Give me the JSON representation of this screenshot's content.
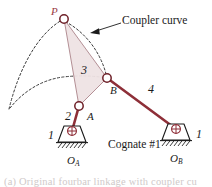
{
  "figure": {
    "background_color": "#ffffff"
  },
  "colors": {
    "link_red": "#8e2f38",
    "link_red_dark": "#6e2028",
    "coupler_fill": "#efe3e4",
    "coupler_stroke": "#b08a90",
    "label_red": "#9a3a45",
    "ink": "#1a1a1a",
    "dashed_curve": "#3a3a3a",
    "caption_faded": "#cfc9c9"
  },
  "labels": {
    "point_P": "P",
    "coupler_curve": "Coupler curve",
    "link_3": "3",
    "link_4": "4",
    "link_2": "2",
    "joint_B": "B",
    "joint_A": "A",
    "ground_left": "1",
    "ground_right": "1",
    "pivot_O_letter": "O",
    "pivot_OA_sub": "A",
    "pivot_OB_sub": "B",
    "cognate": "Cognate #1"
  },
  "caption": "(a)  Original fourbar linkage with coupler cu",
  "geometry": {
    "P": [
      64,
      19
    ],
    "A": [
      79,
      106
    ],
    "B": [
      107,
      78
    ],
    "O_A": [
      72,
      131
    ],
    "O_B": [
      176,
      129
    ]
  },
  "icons": {
    "ground_pivot": "ground-pivot-icon",
    "revolute_joint": "revolute-joint-icon",
    "leader_arrow": "arrow-icon"
  }
}
